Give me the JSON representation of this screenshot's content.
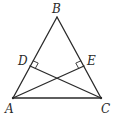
{
  "diagram": {
    "type": "geometry-triangle",
    "colors": {
      "stroke": "#2a2a2a",
      "background": "#ffffff"
    },
    "points": {
      "A": {
        "label": "A",
        "x": 13,
        "y": 98
      },
      "B": {
        "label": "B",
        "x": 57,
        "y": 17
      },
      "C": {
        "label": "C",
        "x": 101,
        "y": 98
      },
      "D": {
        "label": "D",
        "x": 30,
        "y": 66
      },
      "E": {
        "label": "E",
        "x": 84,
        "y": 66
      }
    },
    "segments": [
      {
        "from": "A",
        "to": "B"
      },
      {
        "from": "B",
        "to": "C"
      },
      {
        "from": "A",
        "to": "C"
      },
      {
        "from": "A",
        "to": "E"
      },
      {
        "from": "C",
        "to": "D"
      }
    ],
    "right_angles": [
      {
        "at": "D",
        "description": "CD perpendicular to AB"
      },
      {
        "at": "E",
        "description": "AE perpendicular to BC"
      }
    ]
  }
}
